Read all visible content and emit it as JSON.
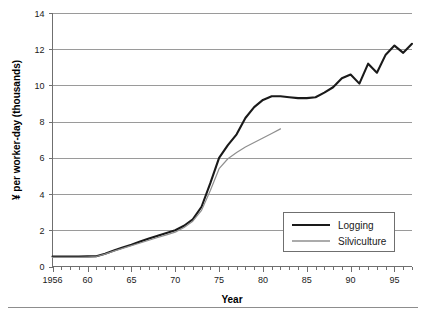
{
  "chart_data": {
    "type": "line",
    "title": "",
    "xlabel": "Year",
    "ylabel": "¥ per worker-day (thousands)",
    "xlim": [
      1956,
      1997
    ],
    "ylim": [
      0,
      14
    ],
    "yticks": [
      0,
      2,
      4,
      6,
      8,
      10,
      12,
      14
    ],
    "ytick_labels": [
      "0",
      "2",
      "4",
      "6",
      "8",
      "10",
      "12",
      "14"
    ],
    "xticks": [
      1956,
      1960,
      1965,
      1970,
      1975,
      1980,
      1985,
      1990,
      1995
    ],
    "xtick_labels": [
      "1956",
      "60",
      "65",
      "70",
      "75",
      "80",
      "85",
      "90",
      "95"
    ],
    "xtick_minor_step": 1,
    "grid": "horizontal",
    "legend_position": "lower-right inside plot",
    "series": [
      {
        "name": "Logging",
        "color": "#1a1a1a",
        "width": 2.1,
        "x": [
          1956,
          1957,
          1958,
          1959,
          1960,
          1961,
          1962,
          1963,
          1964,
          1965,
          1966,
          1967,
          1968,
          1969,
          1970,
          1971,
          1972,
          1973,
          1974,
          1975,
          1976,
          1977,
          1978,
          1979,
          1980,
          1981,
          1982,
          1983,
          1984,
          1985,
          1986,
          1987,
          1988,
          1989,
          1990,
          1991,
          1992,
          1993,
          1994,
          1995,
          1996,
          1997
        ],
        "values": [
          0.55,
          0.55,
          0.55,
          0.55,
          0.56,
          0.57,
          0.7,
          0.88,
          1.05,
          1.2,
          1.38,
          1.55,
          1.7,
          1.85,
          2.0,
          2.25,
          2.6,
          3.3,
          4.6,
          6.0,
          6.7,
          7.3,
          8.2,
          8.8,
          9.2,
          9.4,
          9.4,
          9.35,
          9.3,
          9.3,
          9.35,
          9.6,
          9.9,
          10.4,
          10.6,
          10.1,
          11.2,
          10.7,
          11.7,
          12.2,
          11.8,
          12.3
        ]
      },
      {
        "name": "Silviculture",
        "color": "#8f8f8f",
        "width": 1.2,
        "x": [
          1956,
          1957,
          1958,
          1959,
          1960,
          1961,
          1962,
          1963,
          1964,
          1965,
          1966,
          1967,
          1968,
          1969,
          1970,
          1971,
          1972,
          1973,
          1974,
          1975,
          1976,
          1977,
          1978,
          1979,
          1980,
          1981,
          1982
        ],
        "values": [
          0.5,
          0.5,
          0.5,
          0.5,
          0.52,
          0.55,
          0.68,
          0.85,
          1.0,
          1.15,
          1.3,
          1.45,
          1.6,
          1.75,
          1.9,
          2.15,
          2.5,
          3.1,
          4.2,
          5.4,
          5.95,
          6.3,
          6.6,
          6.85,
          7.1,
          7.35,
          7.6
        ]
      }
    ]
  },
  "legend": {
    "items": [
      {
        "label": "Logging"
      },
      {
        "label": "Silviculture"
      }
    ]
  }
}
